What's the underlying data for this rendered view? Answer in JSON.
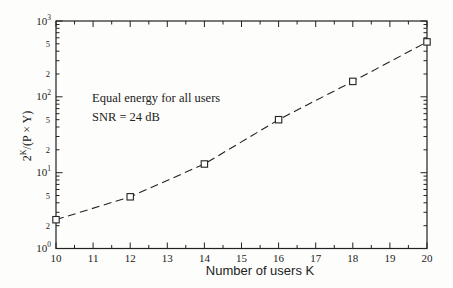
{
  "figure": {
    "background": "#fdfdfb",
    "ink": "#222222",
    "marker_fill": "#ffffff"
  },
  "chart_data": {
    "type": "line",
    "title": "",
    "xlabel": "Number of users K",
    "ylabel": {
      "base": "2",
      "sup": "K",
      "rest": "/(P × Y)"
    },
    "x": [
      10,
      12,
      14,
      16,
      18,
      20
    ],
    "y": [
      2.4,
      4.8,
      13,
      50,
      160,
      530
    ],
    "xlim": [
      10,
      20
    ],
    "ylim": [
      1,
      1000
    ],
    "y_scale": "log",
    "x_major_ticks": [
      10,
      11,
      12,
      13,
      14,
      15,
      16,
      17,
      18,
      19,
      20
    ],
    "x_minor_step": 0.5,
    "y_decade_exponents": [
      0,
      1,
      2,
      3
    ],
    "y_minor_labeled": [
      2,
      5
    ],
    "grid": false,
    "legend": "none",
    "line_style": "dashed",
    "marker": "open-square",
    "annotations": [
      "Equal energy for all users",
      "SNR = 24 dB"
    ]
  }
}
